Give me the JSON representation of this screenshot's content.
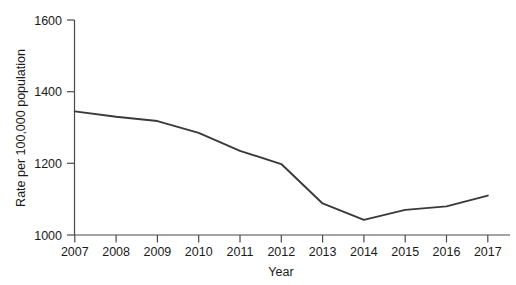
{
  "chart_data": {
    "type": "line",
    "title": "",
    "xlabel": "Year",
    "ylabel": "Rate per 100,000 population",
    "categories": [
      "2007",
      "2008",
      "2009",
      "2010",
      "2011",
      "2012",
      "2013",
      "2014",
      "2015",
      "2016",
      "2017"
    ],
    "x": [
      2007,
      2008,
      2009,
      2010,
      2011,
      2012,
      2013,
      2014,
      2015,
      2016,
      2017
    ],
    "values": [
      1345,
      1330,
      1318,
      1285,
      1235,
      1198,
      1088,
      1042,
      1070,
      1080,
      1110
    ],
    "series": [
      {
        "name": "Rate per 100,000 population",
        "values": [
          1345,
          1330,
          1318,
          1285,
          1235,
          1198,
          1088,
          1042,
          1070,
          1080,
          1110
        ]
      }
    ],
    "xlim": [
      2007,
      2017
    ],
    "ylim": [
      1000,
      1600
    ],
    "ytick_labels": [
      "1000",
      "1200",
      "1400",
      "1600"
    ],
    "yticks": [
      1000,
      1200,
      1400,
      1600
    ],
    "xtick_labels": [
      "2007",
      "2008",
      "2009",
      "2010",
      "2011",
      "2012",
      "2013",
      "2014",
      "2015",
      "2016",
      "2017"
    ],
    "grid": false,
    "legend": false,
    "legend_position": "none",
    "line_color": "#3a3a3a",
    "axis_color": "#4a4a4a",
    "background_color": "#ffffff"
  }
}
